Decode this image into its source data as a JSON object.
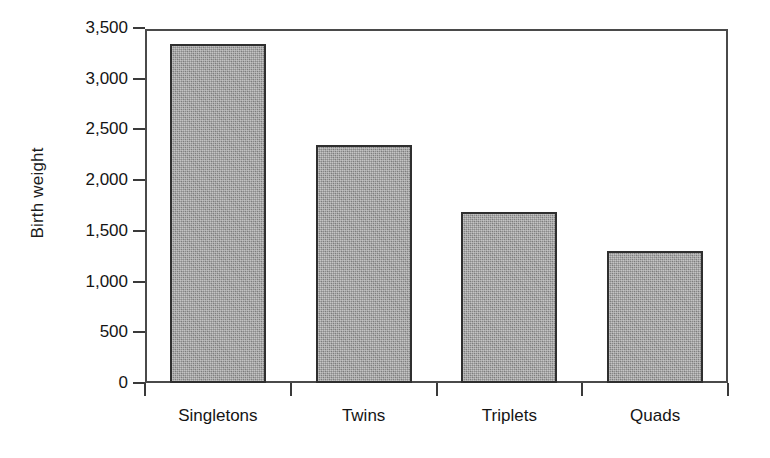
{
  "chart_data": {
    "type": "bar",
    "title": "",
    "xlabel": "",
    "ylabel": "Birth weight",
    "categories": [
      "Singletons",
      "Twins",
      "Triplets",
      "Quads"
    ],
    "values": [
      3340,
      2350,
      1690,
      1300
    ],
    "ylim": [
      0,
      3500
    ],
    "ytick_values": [
      0,
      500,
      1000,
      1500,
      2000,
      2500,
      3000,
      3500
    ],
    "ytick_labels": [
      "0",
      "500",
      "1,000",
      "1,500",
      "2,000",
      "2,500",
      "3,000",
      "3,500"
    ],
    "grid": false,
    "legend": null,
    "bar_color": "#8a8a8a",
    "bar_edge_color": "#2f2f2f",
    "axis_color": "#4a4a4a",
    "background_color": "#ffffff"
  }
}
